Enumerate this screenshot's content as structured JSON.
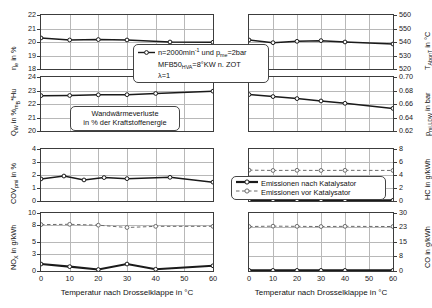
{
  "figure": {
    "xlabel_left": "Temperatur nach Drosselklappe in °C",
    "xlabel_right": "Temperatur nach Drosselklappe in °C",
    "xticks": [
      "0",
      "10",
      "20",
      "30",
      "40",
      "50",
      "60"
    ],
    "colors": {
      "line_after_cat": "#1a1a1a",
      "line_before_cat": "#6b6b6b",
      "grid": "#b8b8b8",
      "axis": "#3c3c3c",
      "background": "#ffffff"
    }
  },
  "annotations": {
    "conditions": {
      "line1": "n=2000min⁻¹ und pₘₑ=2bar",
      "line1_plain": "n=2000min-1 und pme=2bar",
      "line2": "MFB50HVA=8°KW n. ZOT",
      "line3": "λ=1",
      "symbol": "line-marker-after-catalyst"
    },
    "wall_heat": {
      "line1": "Wandwärmeverluste",
      "line2": "in % der Kraftstoffenergie"
    },
    "legend": {
      "items": [
        {
          "label": "Emissionen nach Katalysator",
          "style": "solid-black-circle"
        },
        {
          "label": "Emissionen vor Katalysator",
          "style": "dashed-gray-circle"
        }
      ]
    }
  },
  "chart_data": [
    {
      "id": "eta-e",
      "type": "line",
      "position": "top-left",
      "title": "",
      "xlabel": "Temperatur nach Drosselklappe in °C",
      "ylabel": "ηₑ in %",
      "ylabel_plain": "eta_e in %",
      "xlim": [
        0,
        60
      ],
      "ylim": [
        18,
        22
      ],
      "yticks": [
        "18",
        "19",
        "20",
        "21",
        "22"
      ],
      "ytick_values": [
        18,
        19,
        20,
        21,
        22
      ],
      "grid": true,
      "series": [
        {
          "name": "eta_e",
          "x": [
            0,
            10,
            20,
            30,
            45,
            60
          ],
          "values": [
            20.3,
            20.15,
            20.18,
            20.15,
            20.0,
            19.98
          ]
        }
      ]
    },
    {
      "id": "t-abgnt",
      "type": "line",
      "position": "top-right",
      "xlabel": "Temperatur nach Drosselklappe in °C",
      "ylabel": "Tₐᵦₑ in °C",
      "ylabel_plain": "T_AbgnT in °C",
      "xlim": [
        0,
        60
      ],
      "ylim": [
        520,
        560
      ],
      "yticks": [
        "520",
        "530",
        "540",
        "550",
        "560"
      ],
      "ytick_values": [
        520,
        530,
        540,
        550,
        560
      ],
      "grid": true,
      "series": [
        {
          "name": "T_AbgnT",
          "x": [
            0,
            10,
            20,
            30,
            40,
            60
          ],
          "values": [
            541.5,
            539.5,
            540.5,
            541.0,
            540.0,
            538.5
          ]
        }
      ]
    },
    {
      "id": "qw",
      "type": "line",
      "position": "mid-upper-left",
      "xlabel": "Temperatur nach Drosselklappe in °C",
      "ylabel": "Qᴡ in %ₘᵦ*Hu",
      "ylabel_plain": "Q_W in %mB*Hu",
      "xlim": [
        0,
        60
      ],
      "ylim": [
        20,
        24
      ],
      "yticks": [
        "20",
        "21",
        "22",
        "23",
        "24"
      ],
      "ytick_values": [
        20,
        21,
        22,
        23,
        24
      ],
      "grid": true,
      "series": [
        {
          "name": "Q_W",
          "x": [
            0,
            10,
            20,
            30,
            40,
            60
          ],
          "values": [
            22.62,
            22.63,
            22.68,
            22.69,
            22.78,
            22.95
          ]
        }
      ]
    },
    {
      "id": "pmi-ldw",
      "type": "line",
      "position": "mid-upper-right",
      "xlabel": "Temperatur nach Drosselklappe in °C",
      "ylabel": "pₘᵢ,ʟᴅᴡ in bar",
      "ylabel_plain": "p_mi,LDW in bar",
      "xlim": [
        0,
        60
      ],
      "ylim": [
        0.62,
        0.7
      ],
      "yticks": [
        "0.62",
        "0.64",
        "0.66",
        "0.68",
        "0.70"
      ],
      "ytick_values": [
        0.62,
        0.64,
        0.66,
        0.68,
        0.7
      ],
      "grid": true,
      "series": [
        {
          "name": "p_mi_LDW",
          "x": [
            0,
            10,
            20,
            30,
            40,
            60
          ],
          "values": [
            0.674,
            0.671,
            0.668,
            0.6645,
            0.661,
            0.6535
          ]
        }
      ]
    },
    {
      "id": "cov-pmi",
      "type": "line",
      "position": "mid-lower-left",
      "xlabel": "Temperatur nach Drosselklappe in °C",
      "ylabel": "COVₚₘᵢ in %",
      "ylabel_plain": "COV_pmi in %",
      "xlim": [
        0,
        60
      ],
      "ylim": [
        0,
        4
      ],
      "yticks": [
        "0",
        "1",
        "2",
        "3",
        "4"
      ],
      "ytick_values": [
        0,
        1,
        2,
        3,
        4
      ],
      "grid": true,
      "series": [
        {
          "name": "COV_pmi",
          "x": [
            0,
            8,
            15,
            22,
            30,
            45,
            60
          ],
          "values": [
            1.7,
            1.92,
            1.62,
            1.8,
            1.72,
            1.82,
            1.45
          ]
        }
      ]
    },
    {
      "id": "hc",
      "type": "line",
      "position": "mid-lower-right",
      "xlabel": "Temperatur nach Drosselklappe in °C",
      "ylabel": "HC in g/kWh",
      "ylabel_plain": "HC in g/kWh",
      "xlim": [
        0,
        60
      ],
      "ylim": [
        0,
        8
      ],
      "yticks": [
        "0",
        "2",
        "4",
        "6",
        "8"
      ],
      "ytick_values": [
        0,
        2,
        4,
        6,
        8
      ],
      "grid": true,
      "series": [
        {
          "name": "Emissionen vor Katalysator",
          "style": "dashed-gray-circle",
          "x": [
            0,
            10,
            20,
            30,
            40,
            60
          ],
          "values": [
            4.75,
            4.7,
            4.72,
            4.7,
            4.72,
            4.7
          ]
        },
        {
          "name": "Emissionen nach Katalysator",
          "style": "solid-black-circle",
          "x": [
            0,
            10,
            20,
            30,
            40,
            60
          ],
          "values": [
            0.1,
            0.1,
            0.1,
            0.1,
            0.1,
            0.1
          ]
        }
      ]
    },
    {
      "id": "nox",
      "type": "line",
      "position": "bottom-left",
      "xlabel": "Temperatur nach Drosselklappe in °C",
      "ylabel": "NOₓ in g/kWh",
      "ylabel_plain": "NOX in g/kWh",
      "xlim": [
        0,
        60
      ],
      "ylim": [
        0,
        10
      ],
      "yticks": [
        "0",
        "3",
        "5",
        "8",
        "10"
      ],
      "ytick_values": [
        0,
        3,
        5,
        8,
        10
      ],
      "grid": true,
      "series": [
        {
          "name": "Emissionen vor Katalysator",
          "style": "dashed-gray-circle",
          "x": [
            0,
            10,
            20,
            30,
            40,
            60
          ],
          "values": [
            8.0,
            8.05,
            7.9,
            7.5,
            7.7,
            7.7
          ]
        },
        {
          "name": "Emissionen nach Katalysator",
          "style": "solid-black-circle",
          "x": [
            0,
            10,
            20,
            30,
            40,
            60
          ],
          "values": [
            1.2,
            0.75,
            0.25,
            1.2,
            0.3,
            0.9
          ]
        }
      ]
    },
    {
      "id": "co",
      "type": "line",
      "position": "bottom-right",
      "xlabel": "Temperatur nach Drosselklappe in °C",
      "ylabel": "CO in g/kWh",
      "ylabel_plain": "CO in g/kWh",
      "xlim": [
        0,
        60
      ],
      "ylim": [
        0,
        30
      ],
      "yticks": [
        "0",
        "8",
        "15",
        "23",
        "30"
      ],
      "ytick_values": [
        0,
        8,
        15,
        23,
        30
      ],
      "grid": true,
      "series": [
        {
          "name": "Emissionen vor Katalysator",
          "style": "dashed-gray-circle",
          "x": [
            0,
            10,
            20,
            30,
            40,
            60
          ],
          "values": [
            23.0,
            23.2,
            23.1,
            23.0,
            23.1,
            23.0
          ]
        },
        {
          "name": "Emissionen nach Katalysator",
          "style": "solid-black-circle",
          "x": [
            0,
            10,
            20,
            30,
            40,
            60
          ],
          "values": [
            0.3,
            0.3,
            0.3,
            0.3,
            0.3,
            0.3
          ]
        }
      ]
    }
  ]
}
